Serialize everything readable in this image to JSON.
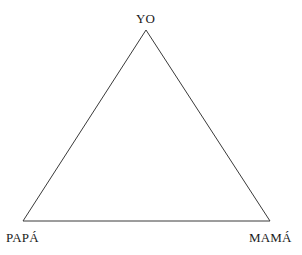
{
  "diagram": {
    "type": "triangle-diagram",
    "title": "",
    "background_color": "#ffffff",
    "stroke_color": "#3a3a3a",
    "stroke_width": 1,
    "text_color": "#1a1a1a",
    "canvas": {
      "width": 302,
      "height": 255
    },
    "shape": {
      "name": "triangle",
      "points": "146,30 270,221 23,221",
      "vertices": [
        {
          "id": "apex",
          "x": 146,
          "y": 30
        },
        {
          "id": "bottom-right",
          "x": 270,
          "y": 221
        },
        {
          "id": "bottom-left",
          "x": 23,
          "y": 221
        }
      ]
    },
    "nodes": [
      {
        "id": "yo",
        "label": "YO",
        "position": "top"
      },
      {
        "id": "papa",
        "label": "PAPÁ",
        "position": "bottom-left"
      },
      {
        "id": "mama",
        "label": "MAMÁ",
        "position": "bottom-right"
      }
    ]
  }
}
